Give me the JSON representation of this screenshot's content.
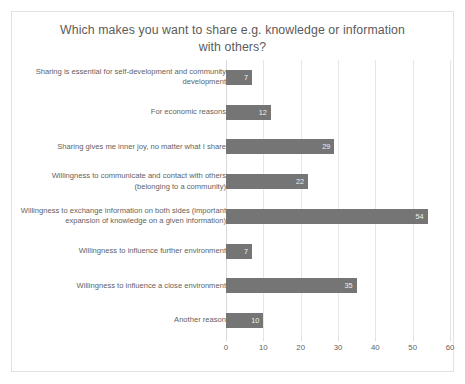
{
  "chart_data": {
    "type": "bar",
    "orientation": "horizontal",
    "title": "Which makes you want to share e.g. knowledge or information with others?",
    "title_lines": [
      "Which makes you want to share e.g. knowledge or information",
      "with others?"
    ],
    "categories": [
      "Sharing is essential for self-development and community development",
      "For economic reasons",
      "Sharing gives me inner joy, no matter what I share",
      "Willingness to communicate and contact with others (belonging to a community)",
      "Willingness to exchange information on both sides (important expansion of knowledge on a given information)",
      "Willingness to influence further environment",
      "Willingness to influence a close environment",
      "Another reason"
    ],
    "values": [
      7,
      12,
      29,
      22,
      54,
      7,
      35,
      10
    ],
    "data_labels": [
      "7",
      "12",
      "29",
      "22",
      "54",
      "7",
      "35",
      "10"
    ],
    "xlabel": "",
    "ylabel": "",
    "xlim": [
      0,
      60
    ],
    "xticks": [
      0,
      10,
      20,
      30,
      40,
      50,
      60
    ],
    "xtick_labels": [
      "0",
      "10",
      "20",
      "30",
      "40",
      "50",
      "60"
    ],
    "grid": "vertical",
    "legend": "none",
    "bar_color": "#757575",
    "gridline_color": "#e6e6e6",
    "text_color": "#5f5f5f",
    "background_color": "#ffffff",
    "border_color": "#e2e2e2"
  }
}
